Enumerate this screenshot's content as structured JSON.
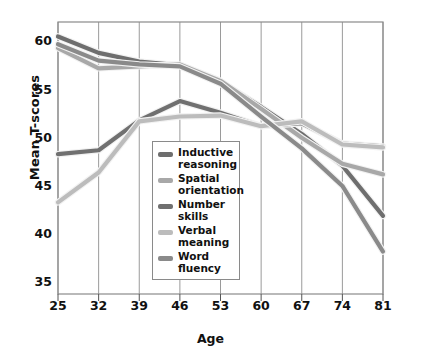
{
  "chart_data": {
    "type": "line",
    "title": "",
    "xlabel": "Age",
    "ylabel": "Mean T-scores",
    "x": [
      25,
      32,
      39,
      46,
      53,
      60,
      67,
      74,
      81
    ],
    "xticklabels": [
      "25",
      "32",
      "39",
      "46",
      "53",
      "60",
      "67",
      "74",
      "81"
    ],
    "yticklabels": [
      "35",
      "40",
      "45",
      "50",
      "55",
      "60"
    ],
    "yticks": [
      35,
      40,
      45,
      50,
      55,
      60
    ],
    "xlim": [
      25,
      81
    ],
    "ylim": [
      33.8,
      62.0
    ],
    "grid": "vertical",
    "legend_position": "center",
    "series": [
      {
        "name": "Inductive reasoning",
        "label": "Inductive\nreasoning",
        "color": "#6e6e6e",
        "values": [
          60.5,
          58.8,
          57.9,
          57.5,
          55.8,
          53.2,
          50.4,
          47.1,
          41.9
        ]
      },
      {
        "name": "Spatial orientation",
        "label": "Spatial\norientation",
        "color": "#a8a8a8",
        "values": [
          59.3,
          57.2,
          57.4,
          57.6,
          55.9,
          53.0,
          50.0,
          47.3,
          46.2
        ]
      },
      {
        "name": "Number skills",
        "label": "Number\nskills",
        "color": "#707070",
        "values": [
          48.3,
          48.7,
          51.8,
          53.8,
          52.6,
          51.2,
          51.5,
          49.4,
          49.1
        ]
      },
      {
        "name": "Verbal meaning",
        "label": "Verbal\nmeaning",
        "color": "#bcbcbc",
        "values": [
          43.3,
          46.4,
          51.7,
          52.2,
          52.3,
          51.2,
          51.7,
          49.3,
          49.0
        ]
      },
      {
        "name": "Word fluency",
        "label": "Word\nfluency",
        "color": "#8a8a8a",
        "values": [
          59.7,
          58.0,
          57.6,
          57.4,
          55.6,
          52.2,
          48.9,
          45.0,
          38.2
        ]
      }
    ]
  },
  "axis": {
    "y_title": "Mean T-scores",
    "x_title": "Age"
  }
}
